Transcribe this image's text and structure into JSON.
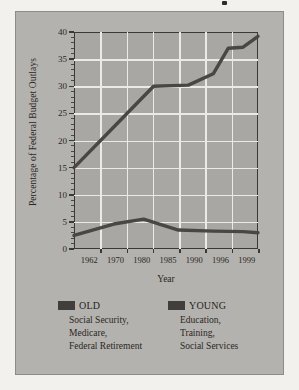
{
  "chart_data": {
    "type": "line",
    "title": "",
    "xlabel": "Year",
    "ylabel": "Percentage of Federal Budget Outlays",
    "x": [
      1962,
      1970,
      1980,
      1985,
      1990,
      1996,
      1999
    ],
    "categories": [
      "1962",
      "1970",
      "1980",
      "1985",
      "1990",
      "1996",
      "1999"
    ],
    "xlim": [
      1962,
      1999
    ],
    "ylim": [
      0,
      40
    ],
    "yticks": [
      0,
      5,
      10,
      15,
      20,
      25,
      30,
      35,
      40
    ],
    "ytick_labels": [
      "0",
      "5",
      "10",
      "15",
      "20",
      "25",
      "30",
      "35",
      "40"
    ],
    "minor_yticks": true,
    "grid": "both",
    "legend_position": "below",
    "series": [
      {
        "name": "OLD",
        "color": "#4a4643",
        "values": [
          15.0,
          22.5,
          30.0,
          30.2,
          32.3,
          37.2,
          39.2
        ],
        "vertices": [
          {
            "x": 1962,
            "y": 15.0
          },
          {
            "x": 1970,
            "y": 22.5
          },
          {
            "x": 1978,
            "y": 30.0
          },
          {
            "x": 1985,
            "y": 30.2
          },
          {
            "x": 1990,
            "y": 32.3
          },
          {
            "x": 1993,
            "y": 37.0
          },
          {
            "x": 1996,
            "y": 37.2
          },
          {
            "x": 1999,
            "y": 39.2
          }
        ]
      },
      {
        "name": "YOUNG",
        "color": "#4a4643",
        "values": [
          2.5,
          4.6,
          5.2,
          3.5,
          3.3,
          3.2,
          3.0
        ],
        "vertices": [
          {
            "x": 1962,
            "y": 2.5
          },
          {
            "x": 1970,
            "y": 4.6
          },
          {
            "x": 1976,
            "y": 5.5
          },
          {
            "x": 1983,
            "y": 3.5
          },
          {
            "x": 1990,
            "y": 3.3
          },
          {
            "x": 1996,
            "y": 3.2
          },
          {
            "x": 1999,
            "y": 3.0
          }
        ]
      }
    ]
  },
  "axes": {
    "y_title": "Percentage of Federal Budget Outlays",
    "x_title": "Year",
    "y_labels": [
      "40",
      "35",
      "30",
      "25",
      "20",
      "15",
      "10",
      "5",
      "0"
    ],
    "x_labels": [
      "1962",
      "1970",
      "1980",
      "1985",
      "1990",
      "1996",
      "1999"
    ]
  },
  "legend": {
    "old": {
      "title": "OLD",
      "swatch_color": "#413e3b",
      "lines": [
        "Social Security,",
        "Medicare,",
        "Federal Retirement"
      ]
    },
    "young": {
      "title": "YOUNG",
      "swatch_color": "#413e3b",
      "lines": [
        "Education,",
        "Training,",
        "Social Services"
      ]
    }
  },
  "colors": {
    "page_background": "#f3f1ed",
    "panel_background": "#b4b2ae",
    "plot_background": "#a9a7a3",
    "gridline": "#eceae6",
    "axis": "#3b3835",
    "text": "#2a2724"
  }
}
